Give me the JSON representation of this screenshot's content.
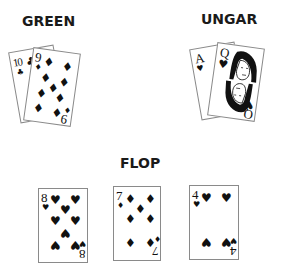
{
  "players": [
    {
      "name": "GREEN",
      "hand": [
        {
          "rank": "10",
          "suit": "clubs",
          "suit_symbol": "♣"
        },
        {
          "rank": "9",
          "suit": "diamonds",
          "suit_symbol": "♦"
        }
      ]
    },
    {
      "name": "UNGAR",
      "hand": [
        {
          "rank": "A",
          "suit": "hearts",
          "suit_symbol": "♥"
        },
        {
          "rank": "Q",
          "suit": "hearts",
          "suit_symbol": "♥"
        }
      ]
    }
  ],
  "board": {
    "label": "FLOP",
    "cards": [
      {
        "rank": "8",
        "suit": "hearts",
        "suit_symbol": "♥"
      },
      {
        "rank": "7",
        "suit": "diamonds",
        "suit_symbol": "♦"
      },
      {
        "rank": "4",
        "suit": "hearts",
        "suit_symbol": "♥"
      }
    ]
  },
  "colors": {
    "text": "#1a1a1a",
    "card_border": "#8a8a8a",
    "pip": "#111111"
  }
}
